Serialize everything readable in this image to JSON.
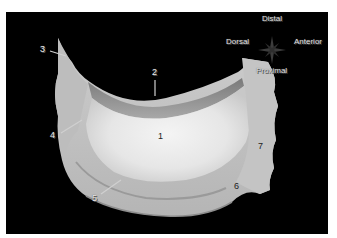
{
  "figure": {
    "background": "#000000",
    "specimen_color": "#cfcfcf",
    "orientation": {
      "top": "Distal",
      "left": "Dorsal",
      "right": "Anterior",
      "bottom": "Proximal"
    },
    "labels": [
      {
        "id": "1",
        "text": "1"
      },
      {
        "id": "2",
        "text": "2"
      },
      {
        "id": "3",
        "text": "3"
      },
      {
        "id": "4",
        "text": "4"
      },
      {
        "id": "5",
        "text": "5"
      },
      {
        "id": "6",
        "text": "6"
      },
      {
        "id": "7",
        "text": "7"
      }
    ]
  }
}
